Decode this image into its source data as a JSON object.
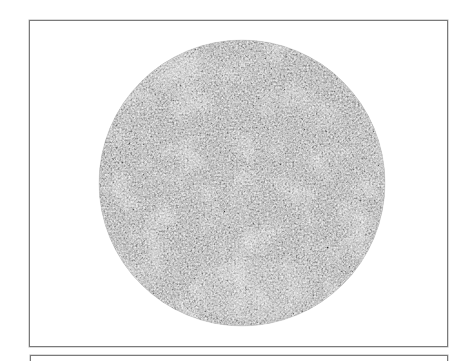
{
  "figure": {
    "panels": [
      {
        "id": "panel-1",
        "content": "circular textured specimen (grainy grayscale field)",
        "specimen": {
          "shape": "circle",
          "center_x": 242,
          "center_y": 183,
          "radius": 143,
          "base_color": "#9a9a9a",
          "light_patch_color": "#e2e2e2",
          "dark_grain_color": "#5c5c5c"
        }
      },
      {
        "id": "panel-2",
        "content": "top edge of next panel (cropped)"
      }
    ],
    "border_color": "#7a7a7a",
    "background_color": "#ffffff"
  }
}
